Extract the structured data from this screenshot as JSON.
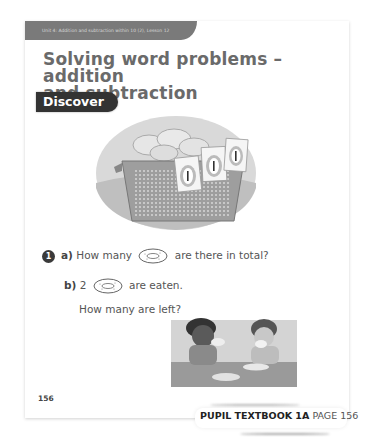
{
  "header": {
    "unit_label": "Unit 4: Addition and subtraction within 10 (2), Lesson 12",
    "title_line1": "Solving word problems – addition",
    "title_line2": "and subtraction"
  },
  "section_badge": "Discover",
  "illustration": {
    "basket_cards": [
      "1",
      "1",
      "1"
    ],
    "description": "basket of ring doughnuts with three label cards"
  },
  "question": {
    "number": "1",
    "part_a": {
      "label": "a)",
      "before": "How many",
      "after": "are there in total?"
    },
    "part_b": {
      "label": "b)",
      "before": "2",
      "after": "are eaten.",
      "line2": "How many are left?"
    }
  },
  "page_number": "156",
  "footer": {
    "book": "PUPIL TEXTBOOK 1A",
    "page": "PAGE 156"
  }
}
